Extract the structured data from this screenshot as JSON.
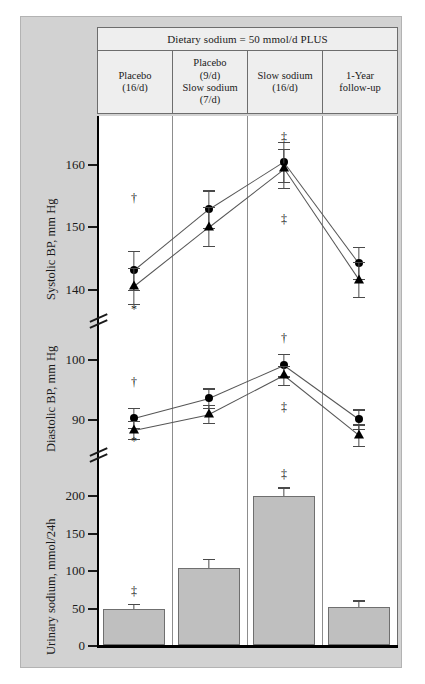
{
  "figure": {
    "header_title": "Dietary sodium = 50 mmol/d PLUS",
    "columns": [
      {
        "lines": [
          "Placebo",
          "(16/d)"
        ]
      },
      {
        "lines": [
          "Placebo",
          "(9/d)",
          "Slow sodium",
          "(7/d)"
        ]
      },
      {
        "lines": [
          "Slow sodium",
          "(16/d)"
        ]
      },
      {
        "lines": [
          "1-Year",
          "follow-up"
        ]
      }
    ]
  },
  "chart_data": [
    {
      "type": "line",
      "title": "Systolic BP",
      "ylabel": "Systolic BP, mm Hg",
      "xlabel": "",
      "categories": [
        "Placebo (16/d)",
        "Placebo (9/d) Slow sodium (7/d)",
        "Slow sodium (16/d)",
        "1-Year follow-up"
      ],
      "ylim": [
        136,
        166
      ],
      "yticks": [
        140,
        150,
        160
      ],
      "grid": false,
      "axis_break": true,
      "series": [
        {
          "name": "Circle group",
          "marker": "circle",
          "values": [
            143.0,
            152.8,
            160.4,
            144.2
          ],
          "errors": [
            3.1,
            3.0,
            3.2,
            2.6
          ]
        },
        {
          "name": "Triangle group",
          "marker": "triangle",
          "values": [
            140.5,
            150.0,
            159.3,
            141.5
          ],
          "errors": [
            2.9,
            3.1,
            3.1,
            2.8
          ]
        }
      ],
      "annotations": [
        {
          "symbol": "†",
          "category_index": 0,
          "position": "above"
        },
        {
          "symbol": "*",
          "category_index": 0,
          "position": "below"
        },
        {
          "symbol": "‡",
          "category_index": 2,
          "position": "above"
        },
        {
          "symbol": "‡",
          "category_index": 2,
          "position": "below"
        }
      ]
    },
    {
      "type": "line",
      "title": "Diastolic BP",
      "ylabel": "Diastolic BP, mm Hg",
      "xlabel": "",
      "categories": [
        "Placebo (16/d)",
        "Placebo (9/d) Slow sodium (7/d)",
        "Slow sodium (16/d)",
        "1-Year follow-up"
      ],
      "ylim": [
        84,
        104
      ],
      "yticks": [
        90,
        100
      ],
      "grid": false,
      "axis_break": true,
      "series": [
        {
          "name": "Circle group",
          "marker": "circle",
          "values": [
            90.2,
            93.5,
            99.0,
            90.0
          ],
          "errors": [
            1.7,
            1.6,
            1.9,
            1.6
          ]
        },
        {
          "name": "Triangle group",
          "marker": "triangle",
          "values": [
            88.2,
            90.8,
            97.3,
            87.3
          ],
          "errors": [
            1.5,
            1.5,
            1.6,
            1.8
          ]
        }
      ],
      "annotations": [
        {
          "symbol": "†",
          "category_index": 0,
          "position": "above"
        },
        {
          "symbol": "*",
          "category_index": 0,
          "position": "below"
        },
        {
          "symbol": "†",
          "category_index": 2,
          "position": "above"
        },
        {
          "symbol": "‡",
          "category_index": 2,
          "position": "below"
        }
      ]
    },
    {
      "type": "bar",
      "title": "Urinary sodium",
      "ylabel": "Urinary sodium, mmol/24h",
      "xlabel": "",
      "categories": [
        "Placebo (16/d)",
        "Placebo (9/d) Slow sodium (7/d)",
        "Slow sodium (16/d)",
        "1-Year follow-up"
      ],
      "values": [
        49,
        103,
        199,
        51
      ],
      "errors": [
        6,
        12,
        11,
        9
      ],
      "ylim": [
        0,
        215
      ],
      "yticks": [
        0,
        50,
        100,
        150,
        200
      ],
      "grid": false,
      "bar_color": "#bfbfbf",
      "annotations": [
        {
          "symbol": "‡",
          "category_index": 0,
          "position": "above"
        },
        {
          "symbol": "‡",
          "category_index": 2,
          "position": "above"
        }
      ]
    }
  ]
}
